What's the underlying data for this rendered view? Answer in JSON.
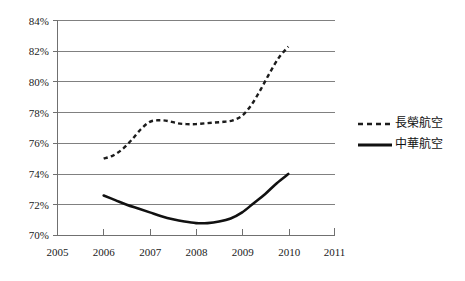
{
  "chart_data": {
    "type": "line",
    "title": "",
    "xlabel": "",
    "ylabel": "",
    "xlim": [
      2005,
      2011
    ],
    "ylim": [
      70,
      84
    ],
    "grid": true,
    "legend_position": "right",
    "x_ticks": [
      "2005",
      "2006",
      "2007",
      "2008",
      "2009",
      "2010",
      "2011"
    ],
    "y_ticks": [
      "70%",
      "72%",
      "74%",
      "76%",
      "78%",
      "80%",
      "82%",
      "84%"
    ],
    "series": [
      {
        "name": "長榮航空",
        "style": "dashed",
        "color": "#1c1c1c",
        "x": [
          2006,
          2006.2,
          2006.4,
          2006.6,
          2006.8,
          2007,
          2007.2,
          2007.4,
          2007.6,
          2007.8,
          2008,
          2008.2,
          2008.4,
          2008.6,
          2008.8,
          2009,
          2009.2,
          2009.4,
          2009.6,
          2009.8,
          2010
        ],
        "values": [
          75.0,
          75.2,
          75.6,
          76.2,
          76.9,
          77.4,
          77.5,
          77.45,
          77.3,
          77.25,
          77.25,
          77.3,
          77.35,
          77.4,
          77.5,
          77.8,
          78.5,
          79.5,
          80.6,
          81.6,
          82.3
        ]
      },
      {
        "name": "中華航空",
        "style": "solid",
        "color": "#111111",
        "x": [
          2006,
          2006.25,
          2006.5,
          2006.75,
          2007,
          2007.25,
          2007.5,
          2007.75,
          2008,
          2008.25,
          2008.5,
          2008.75,
          2009,
          2009.25,
          2009.5,
          2009.75,
          2010
        ],
        "values": [
          72.6,
          72.3,
          72.0,
          71.75,
          71.5,
          71.25,
          71.05,
          70.9,
          70.8,
          70.8,
          70.9,
          71.1,
          71.5,
          72.1,
          72.7,
          73.4,
          74.0
        ]
      }
    ],
    "legend": [
      {
        "label": "長榮航空",
        "style": "dashed"
      },
      {
        "label": "中華航空",
        "style": "solid"
      }
    ]
  },
  "axes": {
    "y_tick_0": "70%",
    "y_tick_1": "72%",
    "y_tick_2": "74%",
    "y_tick_3": "76%",
    "y_tick_4": "78%",
    "y_tick_5": "80%",
    "y_tick_6": "82%",
    "y_tick_7": "84%",
    "x_tick_0": "2005",
    "x_tick_1": "2006",
    "x_tick_2": "2007",
    "x_tick_3": "2008",
    "x_tick_4": "2009",
    "x_tick_5": "2010",
    "x_tick_6": "2011"
  },
  "legend": {
    "item_0_label": "長榮航空",
    "item_1_label": "中華航空"
  }
}
